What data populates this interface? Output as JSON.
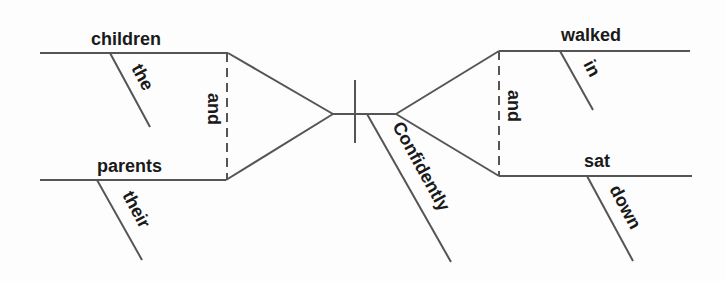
{
  "diagram": {
    "type": "sentence-diagram",
    "sentence_parts": {
      "subjects": [
        {
          "word": "children",
          "modifier": "the"
        },
        {
          "word": "parents",
          "modifier": "their"
        }
      ],
      "subject_conjunction": "and",
      "predicates": [
        {
          "word": "walked",
          "modifier": "in"
        },
        {
          "word": "sat",
          "modifier": "down"
        }
      ],
      "predicate_conjunction": "and",
      "shared_modifier": "Confidently"
    },
    "colors": {
      "line": "#555555",
      "text": "#1a1a1a",
      "background": "#fdfdfd"
    }
  }
}
